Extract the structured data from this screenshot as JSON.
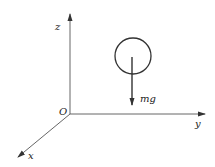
{
  "diagram": {
    "type": "3d-coordinate-free-body",
    "axes": {
      "z": {
        "label": "z"
      },
      "y": {
        "label": "y"
      },
      "x": {
        "label": "x"
      },
      "origin": {
        "label": "O"
      }
    },
    "body": {
      "shape": "circle"
    },
    "force": {
      "label": "mg",
      "direction": "down"
    },
    "colors": {
      "stroke": "#333333",
      "background": "#ffffff"
    }
  }
}
